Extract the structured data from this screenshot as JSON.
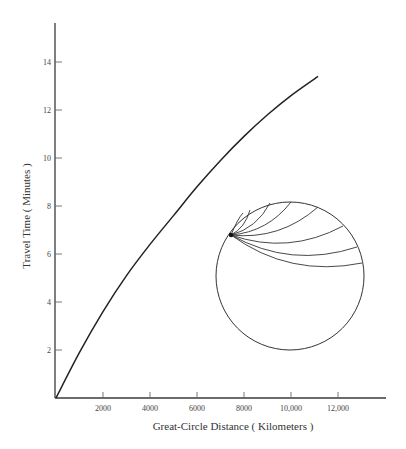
{
  "chart_data": {
    "type": "line",
    "title": "",
    "xlabel": "Great-Circle Distance ( Kilometers )",
    "ylabel": "Travel Time ( Minutes )",
    "xlim": [
      0,
      14000
    ],
    "ylim": [
      0,
      15.5
    ],
    "x_ticks": [
      2000,
      4000,
      6000,
      8000,
      10000,
      12000
    ],
    "x_tick_labels": [
      "2000",
      "4000",
      "6000",
      "8000",
      "10,000",
      "12,000"
    ],
    "y_ticks": [
      2,
      4,
      6,
      8,
      10,
      12,
      14
    ],
    "y_tick_labels": [
      "2",
      "4",
      "6",
      "8",
      "10",
      "12",
      "14"
    ],
    "grid": false,
    "legend": null,
    "series": [
      {
        "name": "Travel-time curve",
        "x": [
          0,
          1000,
          2000,
          3000,
          4000,
          5000,
          6000,
          7000,
          8000,
          9000,
          10000,
          11150
        ],
        "y": [
          0,
          1.9,
          3.6,
          5.1,
          6.4,
          7.6,
          8.8,
          9.9,
          10.9,
          11.8,
          12.6,
          13.4
        ]
      }
    ],
    "annotations": [
      {
        "type": "inset-diagram",
        "description": "Earth cross-section with seismic ray paths fanning from a surface source point",
        "ray_count": 8
      }
    ]
  },
  "layout": {
    "plot": {
      "x0": 56,
      "y0": 398,
      "px_per_km": 0.0235,
      "px_per_min": 24,
      "x_axis_end": 386,
      "y_axis_top": 23
    },
    "inset": {
      "cx": 290,
      "cy": 276,
      "r": 74,
      "source": [
        231,
        235
      ],
      "ray_ends": [
        [
          250,
          210
        ],
        [
          270,
          203
        ],
        [
          291,
          202
        ],
        [
          318,
          207
        ],
        [
          343,
          226
        ],
        [
          357,
          247
        ],
        [
          362,
          263
        ]
      ]
    }
  }
}
